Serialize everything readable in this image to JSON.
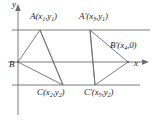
{
  "figure": {
    "type": "geometry-diagram",
    "axes": {
      "y_axis_label": "y",
      "x_axis_label": "x",
      "origin_px": [
        18,
        62
      ]
    },
    "guide_lines": [
      {
        "name": "line-y1",
        "orientation": "horizontal",
        "y_px": 30,
        "x_from_px": 12,
        "x_to_px": 150
      },
      {
        "name": "line-y2",
        "orientation": "horizontal",
        "y_px": 85,
        "x_from_px": 12,
        "x_to_px": 140
      }
    ],
    "points": [
      {
        "id": "A",
        "label_main": "A",
        "prime": "",
        "coords": "(x1,y1)",
        "x_sub": "1",
        "y_sub": "1",
        "px": [
          40,
          30
        ]
      },
      {
        "id": "Ap",
        "label_main": "A",
        "prime": "'",
        "coords": "(x3,y1)",
        "x_sub": "3",
        "y_sub": "1",
        "px": [
          90,
          30
        ]
      },
      {
        "id": "B",
        "label_main": "B",
        "prime": "",
        "coords": "",
        "x_sub": "",
        "y_sub": "",
        "px": [
          18,
          62
        ]
      },
      {
        "id": "Bp",
        "label_main": "B",
        "prime": "'",
        "coords": "(x4,0)",
        "x_sub": "4",
        "y_sub": "",
        "px": [
          128,
          62
        ]
      },
      {
        "id": "C",
        "label_main": "C",
        "prime": "",
        "coords": "(x2,y2)",
        "x_sub": "2",
        "y_sub": "2",
        "px": [
          63,
          85
        ]
      },
      {
        "id": "Cp",
        "label_main": "C",
        "prime": "'",
        "coords": "(x5,y2)",
        "x_sub": "5",
        "y_sub": "2",
        "px": [
          95,
          85
        ]
      }
    ],
    "triangles": [
      {
        "name": "triangle-ABC",
        "vertices": [
          "A",
          "B",
          "C"
        ]
      },
      {
        "name": "triangle-ApBpCp",
        "vertices": [
          "Ap",
          "Bp",
          "Cp"
        ]
      }
    ],
    "labels": {
      "A": {
        "name": "A",
        "prime": "",
        "open": "(",
        "x": "x",
        "xs": "1",
        "comma": ",",
        "y": "y",
        "ys": "1",
        "close": ")"
      },
      "Ap": {
        "name": "A",
        "prime": "′",
        "open": "(",
        "x": "x",
        "xs": "3",
        "comma": ",",
        "y": "y",
        "ys": "1",
        "close": ")"
      },
      "B": {
        "name": "B"
      },
      "Bp": {
        "name": "B",
        "prime": "′",
        "open": "(",
        "x": "x",
        "xs": "4",
        "comma": ",",
        "y": "0",
        "ys": "",
        "close": ")"
      },
      "C": {
        "name": "C",
        "prime": "",
        "open": "(",
        "x": "x",
        "xs": "2",
        "comma": ",",
        "y": "y",
        "ys": "2",
        "close": ")"
      },
      "Cp": {
        "name": "C",
        "prime": "′",
        "open": "(",
        "x": "x",
        "xs": "5",
        "comma": ",",
        "y": "y",
        "ys": "2",
        "close": ")"
      },
      "y_axis": "y",
      "x_axis": "x"
    },
    "colors": {
      "line": "#6e6e6e",
      "axis": "#6e6e6e",
      "text": "#1a1a1a",
      "background": "#ffffff"
    }
  }
}
